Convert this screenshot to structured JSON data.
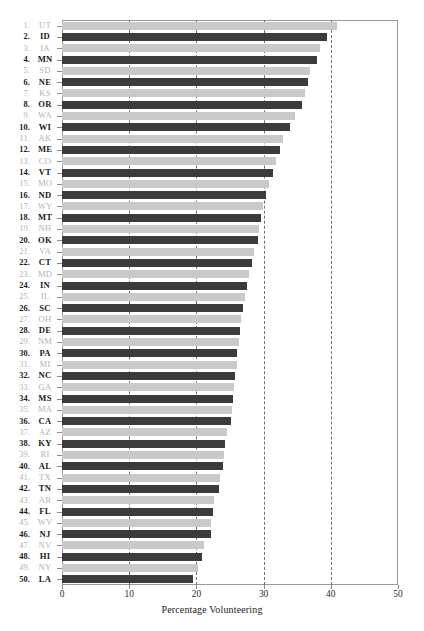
{
  "chart_data": {
    "type": "bar",
    "orientation": "horizontal",
    "title": "",
    "xlabel": "Percentage Volunteering",
    "ylabel": "",
    "xlim": [
      0,
      50
    ],
    "xticks": [
      0,
      10,
      20,
      30,
      40,
      50
    ],
    "gridlines": [
      10,
      20,
      30,
      40
    ],
    "grid": true,
    "legend": null,
    "categories": [
      "UT",
      "ID",
      "IA",
      "MN",
      "SD",
      "NE",
      "KS",
      "OR",
      "WA",
      "WI",
      "AK",
      "ME",
      "CO",
      "VT",
      "MO",
      "ND",
      "WY",
      "MT",
      "NH",
      "OK",
      "VA",
      "CT",
      "MD",
      "IN",
      "IL",
      "SC",
      "OH",
      "DE",
      "NM",
      "PA",
      "MI",
      "NC",
      "GA",
      "MS",
      "MA",
      "CA",
      "AZ",
      "KY",
      "RI",
      "AL",
      "TX",
      "TN",
      "AR",
      "FL",
      "WV",
      "NJ",
      "NV",
      "HI",
      "NY",
      "LA"
    ],
    "ranks": [
      1,
      2,
      3,
      4,
      5,
      6,
      7,
      8,
      9,
      10,
      11,
      12,
      13,
      14,
      15,
      16,
      17,
      18,
      19,
      20,
      21,
      22,
      23,
      24,
      25,
      26,
      27,
      28,
      29,
      30,
      31,
      32,
      33,
      34,
      35,
      36,
      37,
      38,
      39,
      40,
      41,
      42,
      43,
      44,
      45,
      46,
      47,
      48,
      49,
      50
    ],
    "values": [
      40.9,
      39.4,
      38.4,
      38.0,
      36.9,
      36.6,
      36.2,
      35.7,
      34.6,
      33.9,
      32.9,
      32.4,
      31.8,
      31.4,
      30.8,
      30.4,
      29.9,
      29.6,
      29.3,
      29.1,
      28.6,
      28.3,
      27.9,
      27.5,
      27.2,
      26.9,
      26.7,
      26.5,
      26.3,
      26.1,
      26.0,
      25.8,
      25.6,
      25.5,
      25.3,
      25.1,
      24.6,
      24.3,
      24.1,
      24.0,
      23.5,
      23.3,
      22.6,
      22.4,
      22.2,
      22.1,
      21.2,
      20.9,
      20.3,
      19.5
    ],
    "bar_colors": {
      "light": "#c9c9c9",
      "dark": "#3b3b3b"
    },
    "bar_color_pattern": "alternating: odd ranks light, even ranks dark"
  },
  "axis": {
    "tick_labels": [
      "0",
      "10",
      "20",
      "30",
      "40",
      "50"
    ],
    "title": "Percentage Volunteering"
  },
  "style": {
    "frame_color": "#9a9a9a",
    "gridline_color": "#6f6f6f",
    "odd_label_color": "#b2b2b2",
    "even_label_color": "#1a1a1a",
    "background": "#ffffff"
  }
}
